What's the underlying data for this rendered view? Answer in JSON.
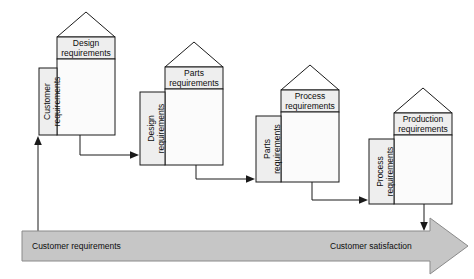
{
  "diagram": {
    "colors": {
      "header_fill": "#eeeeee",
      "body_fill": "#fbfbfb",
      "side_fill": "#eeeeee",
      "line": "#1a1a1a",
      "banner_fill": "#c6c6c6",
      "banner_stroke": "#8a8a8a",
      "background": "#ffffff"
    },
    "houses": [
      {
        "id": "house-1",
        "header_line1": "Design",
        "header_line2": "requirements",
        "side_line1": "Customer",
        "side_line2": "requirements"
      },
      {
        "id": "house-2",
        "header_line1": "Parts",
        "header_line2": "requirements",
        "side_line1": "Design",
        "side_line2": "requirements"
      },
      {
        "id": "house-3",
        "header_line1": "Process",
        "header_line2": "requirements",
        "side_line1": "Parts",
        "side_line2": "requirements"
      },
      {
        "id": "house-4",
        "header_line1": "Production",
        "header_line2": "requirements",
        "side_line1": "Process",
        "side_line2": "requirements"
      }
    ],
    "banner": {
      "left_label": "Customer requirements",
      "right_label": "Customer satisfaction"
    }
  }
}
